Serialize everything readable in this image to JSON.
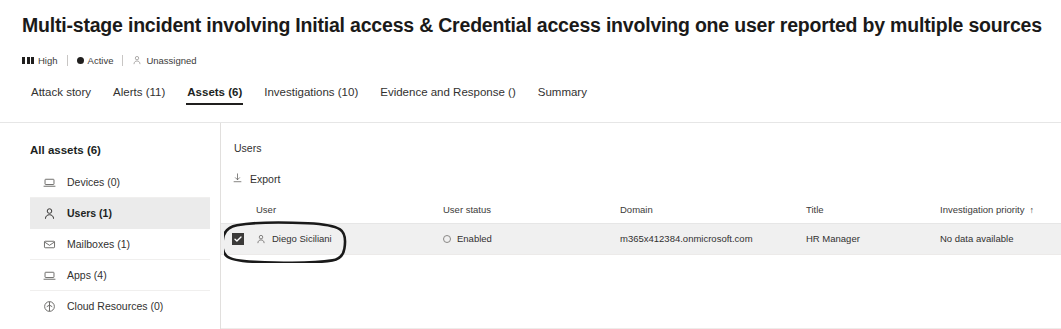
{
  "header": {
    "title": "Multi-stage incident involving Initial access & Credential access involving one user reported by multiple sources",
    "badges": [
      {
        "icon": "severity-bars-icon",
        "label": "High"
      },
      {
        "icon": "active-dot-icon",
        "label": "Active"
      },
      {
        "icon": "person-icon",
        "label": "Unassigned"
      }
    ]
  },
  "tabs": [
    {
      "label": "Attack story",
      "active": false
    },
    {
      "label": "Alerts (11)",
      "active": false
    },
    {
      "label": "Assets (6)",
      "active": true
    },
    {
      "label": "Investigations (10)",
      "active": false
    },
    {
      "label": "Evidence and Response ()",
      "active": false
    },
    {
      "label": "Summary",
      "active": false
    }
  ],
  "sidebar": {
    "heading": "All assets (6)",
    "items": [
      {
        "icon": "device-icon",
        "label": "Devices (0)",
        "selected": false
      },
      {
        "icon": "person-icon",
        "label": "Users (1)",
        "selected": true
      },
      {
        "icon": "mailbox-icon",
        "label": "Mailboxes (1)",
        "selected": false
      },
      {
        "icon": "app-icon",
        "label": "Apps (4)",
        "selected": false
      },
      {
        "icon": "cloud-resource-icon",
        "label": "Cloud Resources (0)",
        "selected": false
      }
    ]
  },
  "main": {
    "title": "Users",
    "toolbar": {
      "export_label": "Export",
      "export_icon": "download-icon"
    },
    "table": {
      "columns": [
        {
          "key": "user",
          "label": "User",
          "sorted": false
        },
        {
          "key": "user_status",
          "label": "User status",
          "sorted": false
        },
        {
          "key": "domain",
          "label": "Domain",
          "sorted": false
        },
        {
          "key": "title",
          "label": "Title",
          "sorted": false
        },
        {
          "key": "investigation_priority",
          "label": "Investigation priority",
          "sorted": true,
          "sort_arrow": "↑"
        }
      ],
      "rows": [
        {
          "selected": true,
          "user": "Diego Siciliani",
          "user_icon": "person-icon",
          "user_status": "Enabled",
          "user_status_icon": "status-ring-icon",
          "domain": "m365x412384.onmicrosoft.com",
          "title": "HR Manager",
          "investigation_priority": "No data available"
        }
      ]
    }
  },
  "annotation": {
    "shape": "hand-drawn-oval",
    "target": "selected user cell",
    "color": "#1a1a1a"
  },
  "colors": {
    "page_background": "#ffffff",
    "text_primary": "#201f1e",
    "text_secondary": "#3b3a39",
    "divider": "#e6e6e6",
    "selected_nav_background": "#ebebeb",
    "selected_row_background": "#f0f0f0",
    "checkbox_fill": "#3b3a39"
  }
}
